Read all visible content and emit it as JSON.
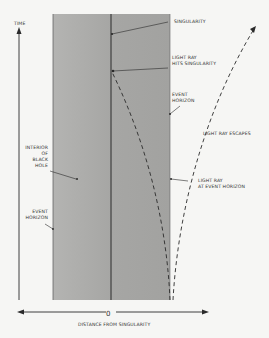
{
  "diagram": {
    "axes": {
      "y_label": "TIME",
      "x_label": "DISTANCE FROM SINGULARITY",
      "origin_label": "0"
    },
    "labels": {
      "singularity": "SINGULARITY",
      "light_ray_hits_1": "LIGHT RAY",
      "light_ray_hits_2": "HITS SINGULARITY",
      "event_horizon_top_1": "EVENT",
      "event_horizon_top_2": "HORIZON",
      "light_ray_escapes": "LIGHT RAY ESCAPES",
      "interior_1": "INTERIOR",
      "interior_2": "OF",
      "interior_3": "BLACK",
      "interior_4": "HOLE",
      "light_ray_eh_1": "LIGHT RAY",
      "light_ray_eh_2": "AT EVENT HORIZON",
      "event_horizon_left_1": "EVENT",
      "event_horizon_left_2": "HORIZON"
    },
    "colors": {
      "interior": "#a9a9a7",
      "line": "#2a2a2a",
      "background": "#f6f6f4"
    }
  }
}
